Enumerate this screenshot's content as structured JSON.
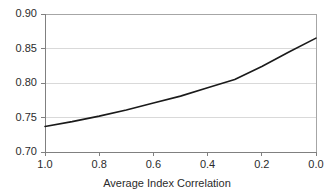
{
  "chart_data": {
    "type": "line",
    "title": "",
    "subtitle": "",
    "xlabel": "Average Index Correlation",
    "ylabel": "",
    "xlim": [
      1.0,
      0.0
    ],
    "ylim": [
      0.7,
      0.9
    ],
    "x_reversed": true,
    "grid": true,
    "grid_axis": "y",
    "legend": false,
    "legend_position": "none",
    "xticks": [
      "1.0",
      "0.8",
      "0.6",
      "0.4",
      "0.2",
      "0.0"
    ],
    "xtick_values": [
      1.0,
      0.8,
      0.6,
      0.4,
      0.2,
      0.0
    ],
    "yticks": [
      "0.90",
      "0.85",
      "0.80",
      "0.75",
      "0.70"
    ],
    "ytick_values": [
      0.9,
      0.85,
      0.8,
      0.75,
      0.7
    ],
    "series": [
      {
        "name": "value",
        "color": "#1a1a1a",
        "line_width": 1.6,
        "x": [
          1.0,
          0.9,
          0.8,
          0.7,
          0.6,
          0.5,
          0.4,
          0.3,
          0.2,
          0.1,
          0.0
        ],
        "values": [
          0.737,
          0.744,
          0.752,
          0.761,
          0.771,
          0.781,
          0.793,
          0.805,
          0.824,
          0.845,
          0.865
        ]
      }
    ],
    "annotations": []
  },
  "axes": {
    "grid_color": "#d9d9d9",
    "axis_color": "#808080",
    "frame_color": "#a6a6a6",
    "tick_color": "#808080",
    "background": "#ffffff"
  }
}
